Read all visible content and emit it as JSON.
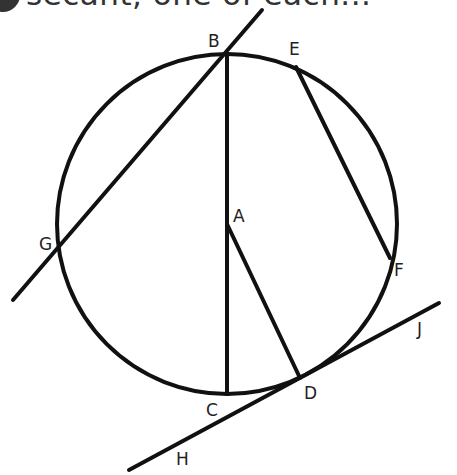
{
  "caption": {
    "text": "secant, one of each...",
    "note": "partially clipped at top edge"
  },
  "diagram": {
    "stroke_color": "#111111",
    "label_color": "#222222",
    "circle": {
      "center": "A",
      "cx": 227,
      "cy": 224,
      "r": 170
    },
    "points": [
      {
        "id": "A",
        "label": "A",
        "x": 227,
        "y": 224,
        "lx": 233,
        "ly": 222
      },
      {
        "id": "B",
        "label": "B",
        "x": 227,
        "y": 54,
        "lx": 208,
        "ly": 47
      },
      {
        "id": "C",
        "label": "C",
        "x": 227,
        "y": 394,
        "lx": 206,
        "ly": 416
      },
      {
        "id": "D",
        "label": "D",
        "x": 300,
        "y": 378,
        "lx": 304,
        "ly": 399
      },
      {
        "id": "E",
        "label": "E",
        "x": 296,
        "y": 67,
        "lx": 289,
        "ly": 55
      },
      {
        "id": "F",
        "label": "F",
        "x": 390,
        "y": 258,
        "lx": 394,
        "ly": 276
      },
      {
        "id": "G",
        "label": "G",
        "x": 61,
        "y": 246,
        "lx": 39,
        "ly": 250
      },
      {
        "id": "H",
        "label": "H",
        "x": 178,
        "y": 464,
        "lx": 176,
        "ly": 465
      },
      {
        "id": "J",
        "label": "J",
        "x": 420,
        "y": 330,
        "lx": 417,
        "ly": 335
      }
    ],
    "segments": [
      {
        "name": "diameter-BC",
        "from": "B",
        "to": "C",
        "x1": 227,
        "y1": 54,
        "x2": 227,
        "y2": 394
      },
      {
        "name": "radius-AD",
        "from": "A",
        "to": "D",
        "x1": 227,
        "y1": 224,
        "x2": 300,
        "y2": 378
      },
      {
        "name": "chord-EF",
        "from": "E",
        "to": "F",
        "x1": 296,
        "y1": 67,
        "x2": 390,
        "y2": 258
      },
      {
        "name": "secant-BG",
        "from": "B",
        "to": "G",
        "x1": 262,
        "y1": 10,
        "x2": 13,
        "y2": 300
      },
      {
        "name": "tangent-HJ",
        "from": "H",
        "to": "J",
        "x1": 129,
        "y1": 470,
        "x2": 439,
        "y2": 303
      }
    ]
  }
}
